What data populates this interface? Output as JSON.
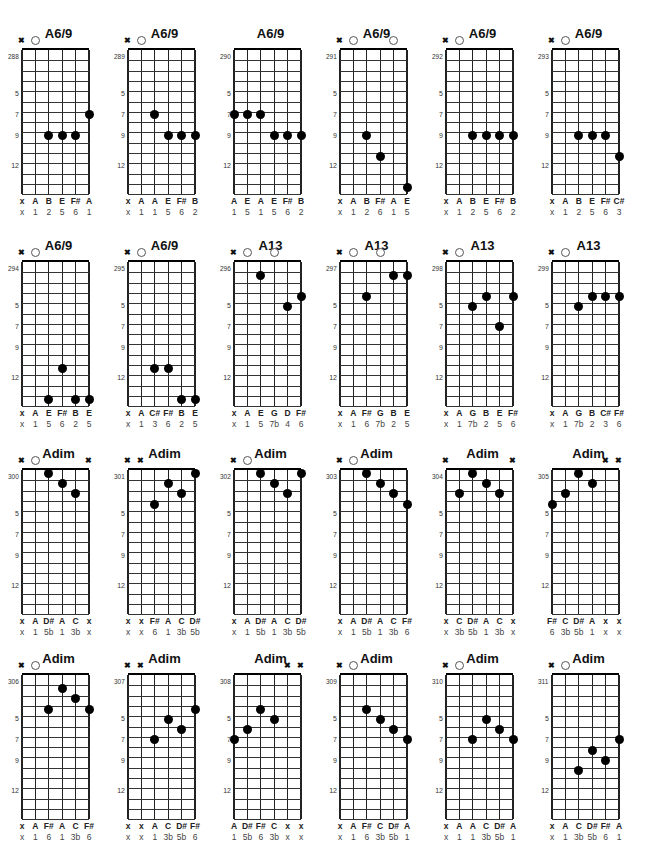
{
  "page": {
    "fret_markers": [
      "5",
      "7",
      "9",
      "12"
    ]
  },
  "layout": {
    "cols_x": [
      25,
      131,
      237,
      343,
      449,
      555
    ],
    "rows_y": [
      0,
      212,
      420,
      625
    ]
  },
  "chords": [
    {
      "name": "A6/9",
      "number": "288",
      "top": [
        "x",
        "o",
        "",
        "",
        "",
        ""
      ],
      "notes": [
        "x",
        "A",
        "B",
        "E",
        "F#",
        "A"
      ],
      "degrees": [
        "x",
        "1",
        "2",
        "5",
        "6",
        "1"
      ],
      "dots": [
        [
          2,
          9
        ],
        [
          3,
          9
        ],
        [
          4,
          9
        ],
        [
          5,
          7
        ]
      ]
    },
    {
      "name": "A6/9",
      "number": "289",
      "top": [
        "x",
        "o",
        "",
        "",
        "",
        ""
      ],
      "notes": [
        "x",
        "A",
        "A",
        "E",
        "F#",
        "B"
      ],
      "degrees": [
        "x",
        "1",
        "1",
        "5",
        "6",
        "2"
      ],
      "dots": [
        [
          2,
          7
        ],
        [
          3,
          9
        ],
        [
          4,
          9
        ],
        [
          5,
          9
        ]
      ]
    },
    {
      "name": "A6/9",
      "number": "290",
      "top": [
        "",
        "",
        "",
        "",
        "",
        ""
      ],
      "notes": [
        "A",
        "E",
        "A",
        "E",
        "F#",
        "B"
      ],
      "degrees": [
        "1",
        "5",
        "1",
        "5",
        "6",
        "2"
      ],
      "dots": [
        [
          0,
          7
        ],
        [
          1,
          7
        ],
        [
          2,
          7
        ],
        [
          3,
          9
        ],
        [
          4,
          9
        ],
        [
          5,
          9
        ]
      ]
    },
    {
      "name": "A6/9",
      "number": "291",
      "top": [
        "x",
        "o",
        "",
        "",
        "o",
        ""
      ],
      "notes": [
        "x",
        "A",
        "B",
        "F#",
        "A",
        "E"
      ],
      "degrees": [
        "x",
        "1",
        "2",
        "6",
        "1",
        "5"
      ],
      "dots": [
        [
          2,
          9
        ],
        [
          3,
          11
        ],
        [
          5,
          14
        ]
      ]
    },
    {
      "name": "A6/9",
      "number": "292",
      "top": [
        "x",
        "o",
        "",
        "",
        "",
        ""
      ],
      "notes": [
        "x",
        "A",
        "B",
        "E",
        "F#",
        "B"
      ],
      "degrees": [
        "x",
        "1",
        "2",
        "5",
        "6",
        "2"
      ],
      "dots": [
        [
          2,
          9
        ],
        [
          3,
          9
        ],
        [
          4,
          9
        ],
        [
          5,
          9
        ]
      ]
    },
    {
      "name": "A6/9",
      "number": "293",
      "top": [
        "x",
        "o",
        "",
        "",
        "",
        ""
      ],
      "notes": [
        "x",
        "A",
        "B",
        "E",
        "F#",
        "C#"
      ],
      "degrees": [
        "x",
        "1",
        "2",
        "5",
        "6",
        "3"
      ],
      "dots": [
        [
          2,
          9
        ],
        [
          3,
          9
        ],
        [
          4,
          9
        ],
        [
          5,
          11
        ]
      ]
    },
    {
      "name": "A6/9",
      "number": "294",
      "top": [
        "x",
        "o",
        "",
        "",
        "",
        ""
      ],
      "notes": [
        "x",
        "A",
        "E",
        "F#",
        "B",
        "E"
      ],
      "degrees": [
        "x",
        "1",
        "5",
        "6",
        "2",
        "5"
      ],
      "dots": [
        [
          2,
          14
        ],
        [
          3,
          11
        ],
        [
          4,
          14
        ],
        [
          5,
          14
        ]
      ]
    },
    {
      "name": "A6/9",
      "number": "295",
      "top": [
        "x",
        "o",
        "",
        "",
        "",
        ""
      ],
      "notes": [
        "x",
        "A",
        "C#",
        "F#",
        "B",
        "E"
      ],
      "degrees": [
        "x",
        "1",
        "3",
        "6",
        "2",
        "5"
      ],
      "dots": [
        [
          2,
          11
        ],
        [
          3,
          11
        ],
        [
          4,
          14
        ],
        [
          5,
          14
        ]
      ]
    },
    {
      "name": "A13",
      "number": "296",
      "top": [
        "x",
        "o",
        "",
        "o",
        "",
        ""
      ],
      "notes": [
        "x",
        "A",
        "E",
        "G",
        "D",
        "F#"
      ],
      "degrees": [
        "x",
        "1",
        "5",
        "7b",
        "4",
        "6"
      ],
      "dots": [
        [
          2,
          2
        ],
        [
          4,
          5
        ],
        [
          5,
          4
        ]
      ]
    },
    {
      "name": "A13",
      "number": "297",
      "top": [
        "x",
        "o",
        "",
        "o",
        "",
        ""
      ],
      "notes": [
        "x",
        "A",
        "F#",
        "G",
        "B",
        "E"
      ],
      "degrees": [
        "x",
        "1",
        "6",
        "7b",
        "2",
        "5"
      ],
      "dots": [
        [
          2,
          4
        ],
        [
          4,
          2
        ],
        [
          5,
          2
        ]
      ]
    },
    {
      "name": "A13",
      "number": "298",
      "top": [
        "x",
        "o",
        "",
        "",
        "",
        ""
      ],
      "notes": [
        "x",
        "A",
        "G",
        "B",
        "E",
        "F#"
      ],
      "degrees": [
        "x",
        "1",
        "7b",
        "2",
        "5",
        "6"
      ],
      "dots": [
        [
          2,
          5
        ],
        [
          3,
          4
        ],
        [
          4,
          7
        ],
        [
          5,
          4
        ]
      ]
    },
    {
      "name": "A13",
      "number": "299",
      "top": [
        "x",
        "o",
        "",
        "",
        "",
        ""
      ],
      "notes": [
        "x",
        "A",
        "G",
        "B",
        "C#",
        "F#"
      ],
      "degrees": [
        "x",
        "1",
        "7b",
        "2",
        "3",
        "6"
      ],
      "dots": [
        [
          2,
          5
        ],
        [
          3,
          4
        ],
        [
          4,
          4
        ],
        [
          5,
          4
        ]
      ]
    },
    {
      "name": "Adim",
      "number": "300",
      "top": [
        "x",
        "o",
        "",
        "",
        "",
        "x"
      ],
      "notes": [
        "x",
        "A",
        "D#",
        "A",
        "C",
        "x"
      ],
      "degrees": [
        "x",
        "1",
        "5b",
        "1",
        "3b",
        "x"
      ],
      "dots": [
        [
          2,
          1
        ],
        [
          3,
          2
        ],
        [
          4,
          3
        ]
      ]
    },
    {
      "name": "Adim",
      "number": "301",
      "top": [
        "x",
        "x",
        "",
        "",
        "",
        ""
      ],
      "notes": [
        "x",
        "x",
        "F#",
        "A",
        "C",
        "D#"
      ],
      "degrees": [
        "x",
        "x",
        "6",
        "1",
        "3b",
        "5b"
      ],
      "dots": [
        [
          2,
          4
        ],
        [
          3,
          2
        ],
        [
          4,
          3
        ],
        [
          5,
          1
        ]
      ]
    },
    {
      "name": "Adim",
      "number": "302",
      "top": [
        "x",
        "o",
        "",
        "",
        "",
        ""
      ],
      "notes": [
        "x",
        "A",
        "D#",
        "A",
        "C",
        "D#"
      ],
      "degrees": [
        "x",
        "1",
        "5b",
        "1",
        "3b",
        "5b"
      ],
      "dots": [
        [
          2,
          1
        ],
        [
          3,
          2
        ],
        [
          4,
          3
        ],
        [
          5,
          1
        ]
      ]
    },
    {
      "name": "Adim",
      "number": "303",
      "top": [
        "x",
        "o",
        "",
        "",
        "",
        ""
      ],
      "notes": [
        "x",
        "A",
        "D#",
        "A",
        "C",
        "F#"
      ],
      "degrees": [
        "x",
        "1",
        "5b",
        "1",
        "3b",
        "6"
      ],
      "dots": [
        [
          2,
          1
        ],
        [
          3,
          2
        ],
        [
          4,
          3
        ],
        [
          5,
          4
        ]
      ]
    },
    {
      "name": "Adim",
      "number": "304",
      "top": [
        "x",
        "",
        "",
        "",
        "",
        "x"
      ],
      "notes": [
        "x",
        "C",
        "D#",
        "A",
        "C",
        "x"
      ],
      "degrees": [
        "x",
        "3b",
        "5b",
        "1",
        "3b",
        "x"
      ],
      "dots": [
        [
          1,
          3
        ],
        [
          2,
          1
        ],
        [
          3,
          2
        ],
        [
          4,
          3
        ]
      ]
    },
    {
      "name": "Adim",
      "number": "305",
      "top": [
        "",
        "",
        "",
        "",
        "x",
        "x"
      ],
      "notes": [
        "F#",
        "C",
        "D#",
        "A",
        "x",
        "x"
      ],
      "degrees": [
        "6",
        "3b",
        "5b",
        "1",
        "x",
        "x"
      ],
      "dots": [
        [
          0,
          4
        ],
        [
          1,
          3
        ],
        [
          2,
          1
        ],
        [
          3,
          2
        ]
      ]
    },
    {
      "name": "Adim",
      "number": "306",
      "top": [
        "x",
        "o",
        "",
        "",
        "",
        ""
      ],
      "notes": [
        "x",
        "A",
        "F#",
        "A",
        "C",
        "F#"
      ],
      "degrees": [
        "x",
        "1",
        "6",
        "1",
        "3b",
        "6"
      ],
      "dots": [
        [
          2,
          4
        ],
        [
          3,
          2
        ],
        [
          4,
          3
        ],
        [
          5,
          4
        ]
      ]
    },
    {
      "name": "Adim",
      "number": "307",
      "top": [
        "x",
        "x",
        "",
        "",
        "",
        ""
      ],
      "notes": [
        "x",
        "x",
        "A",
        "C",
        "D#",
        "F#"
      ],
      "degrees": [
        "x",
        "x",
        "1",
        "3b",
        "5b",
        "6"
      ],
      "dots": [
        [
          2,
          7
        ],
        [
          3,
          5
        ],
        [
          4,
          6
        ],
        [
          5,
          4
        ]
      ]
    },
    {
      "name": "Adim",
      "number": "308",
      "top": [
        "",
        "",
        "",
        "",
        "x",
        "x"
      ],
      "notes": [
        "A",
        "D#",
        "F#",
        "C",
        "x",
        "x"
      ],
      "degrees": [
        "1",
        "5b",
        "6",
        "3b",
        "x",
        "x"
      ],
      "dots": [
        [
          0,
          7
        ],
        [
          1,
          6
        ],
        [
          2,
          4
        ],
        [
          3,
          5
        ]
      ]
    },
    {
      "name": "Adim",
      "number": "309",
      "top": [
        "x",
        "o",
        "",
        "",
        "",
        ""
      ],
      "notes": [
        "x",
        "A",
        "F#",
        "C",
        "D#",
        "A"
      ],
      "degrees": [
        "x",
        "1",
        "6",
        "3b",
        "5b",
        "1"
      ],
      "dots": [
        [
          2,
          4
        ],
        [
          3,
          5
        ],
        [
          4,
          6
        ],
        [
          5,
          7
        ]
      ]
    },
    {
      "name": "Adim",
      "number": "310",
      "top": [
        "x",
        "o",
        "",
        "",
        "",
        ""
      ],
      "notes": [
        "x",
        "A",
        "A",
        "C",
        "D#",
        "A"
      ],
      "degrees": [
        "x",
        "1",
        "1",
        "3b",
        "5b",
        "1"
      ],
      "dots": [
        [
          2,
          7
        ],
        [
          3,
          5
        ],
        [
          4,
          6
        ],
        [
          5,
          7
        ]
      ]
    },
    {
      "name": "Adim",
      "number": "311",
      "top": [
        "x",
        "o",
        "",
        "",
        "",
        ""
      ],
      "notes": [
        "x",
        "A",
        "C",
        "D#",
        "F#",
        "A"
      ],
      "degrees": [
        "x",
        "1",
        "3b",
        "5b",
        "6",
        "1"
      ],
      "dots": [
        [
          2,
          10
        ],
        [
          3,
          8
        ],
        [
          4,
          9
        ],
        [
          5,
          7
        ]
      ]
    }
  ]
}
